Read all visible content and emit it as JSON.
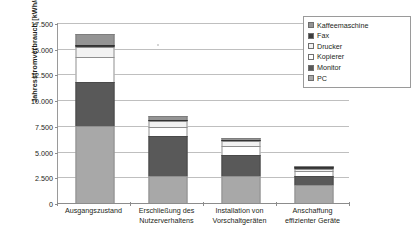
{
  "chart_data": {
    "type": "bar",
    "stacked": true,
    "title": "",
    "xlabel": "",
    "ylabel": "Jahresstromverbrauch [kWh/a]",
    "ylim": [
      0,
      17500
    ],
    "ytick_step": 2500,
    "ytick_labels": [
      "0",
      "2.500",
      "5.000",
      "7.500",
      "10.000",
      "12.500",
      "15.000",
      "17.500"
    ],
    "ytick_values": [
      0,
      2500,
      5000,
      7500,
      10000,
      12500,
      15000,
      17500
    ],
    "grid": true,
    "legend_position": "top-right",
    "categories": [
      "Ausgangszustand",
      "Erschließung des Nutzerverhaltens",
      "Installation von Vorschaltgeräten",
      "Anschaffung effizienter Geräte"
    ],
    "category_lines": [
      [
        "Ausgangszustand"
      ],
      [
        "Erschließung des",
        "Nutzerverhaltens"
      ],
      [
        "Installation von",
        "Vorschaltgeräten"
      ],
      [
        "Anschaffung",
        "effizienter Geräte"
      ]
    ],
    "stack_order_bottom_to_top": [
      "PC",
      "Monitor",
      "Kopierer",
      "Drucker",
      "Fax",
      "Kaffeemaschine"
    ],
    "series": [
      {
        "name": "PC",
        "color": "#a8a8a8",
        "values": [
          7500,
          2600,
          2600,
          1800
        ]
      },
      {
        "name": "Monitor",
        "color": "#595959",
        "values": [
          4250,
          3900,
          2050,
          850
        ]
      },
      {
        "name": "Kopierer",
        "color": "#ffffff",
        "values": [
          2400,
          900,
          900,
          450
        ]
      },
      {
        "name": "Drucker",
        "color": "#f2f2f2",
        "values": [
          1000,
          600,
          450,
          250
        ]
      },
      {
        "name": "Fax",
        "color": "#3d3d3d",
        "values": [
          250,
          100,
          50,
          50
        ]
      },
      {
        "name": "Kaffeemaschine",
        "color": "#949494",
        "values": [
          1000,
          300,
          200,
          100
        ]
      }
    ],
    "totals": [
      16400,
      8400,
      6250,
      3500
    ]
  },
  "legend": {
    "items": [
      {
        "label": "Kaffeemaschine",
        "color": "#949494"
      },
      {
        "label": "Fax",
        "color": "#3d3d3d"
      },
      {
        "label": "Drucker",
        "color": "#f2f2f2"
      },
      {
        "label": "Kopierer",
        "color": "#ffffff"
      },
      {
        "label": "Monitor",
        "color": "#595959"
      },
      {
        "label": "PC",
        "color": "#a8a8a8"
      }
    ]
  }
}
